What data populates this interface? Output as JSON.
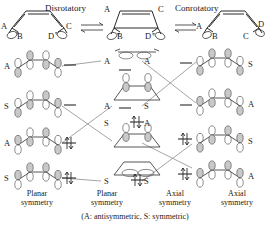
{
  "diagram": {
    "title_caption": "(A: antisymmetric, S: symmetric)",
    "reactions": {
      "disrotatory_label": "Disrotatory",
      "conrotatory_label": "Conrotatory"
    },
    "top_row": {
      "left_molecule": {
        "name": "butadiene-left",
        "substituents": [
          "A",
          "B",
          "D",
          "C"
        ]
      },
      "center_molecule": {
        "name": "cyclobutene",
        "substituents": [
          "A",
          "C",
          "B",
          "D"
        ]
      },
      "right_molecule": {
        "name": "butadiene-right",
        "substituents": [
          "A",
          "D",
          "B",
          "C"
        ]
      }
    },
    "columns": [
      {
        "id": "planar-butadiene",
        "caption_line1": "Planar",
        "caption_line2": "symmetry",
        "levels": [
          {
            "symmetry": "A",
            "occupied": false,
            "electrons": 0
          },
          {
            "symmetry": "S",
            "occupied": false,
            "electrons": 0
          },
          {
            "symmetry": "A",
            "occupied": true,
            "electrons": 2
          },
          {
            "symmetry": "S",
            "occupied": true,
            "electrons": 2
          }
        ]
      },
      {
        "id": "planar-cyclobutene",
        "caption_line1": "Planar",
        "caption_line2": "symmetry",
        "levels": [
          {
            "symmetry": "A",
            "occupied": false,
            "electrons": 0
          },
          {
            "symmetry": "A",
            "occupied": false,
            "electrons": 0
          },
          {
            "symmetry": "S",
            "occupied": true,
            "electrons": 2
          },
          {
            "symmetry": "S",
            "occupied": true,
            "electrons": 2
          }
        ]
      },
      {
        "id": "axial-cyclobutene",
        "caption_line1": "Axial",
        "caption_line2": "symmetry",
        "levels": [
          {
            "symmetry": "A",
            "occupied": false,
            "electrons": 0
          },
          {
            "symmetry": "S",
            "occupied": false,
            "electrons": 0
          },
          {
            "symmetry": "A",
            "occupied": true,
            "electrons": 2
          },
          {
            "symmetry": "S",
            "occupied": true,
            "electrons": 2
          }
        ]
      },
      {
        "id": "axial-butadiene",
        "caption_line1": "Axial",
        "caption_line2": "symmetry",
        "levels": [
          {
            "symmetry": "S",
            "occupied": false,
            "electrons": 0
          },
          {
            "symmetry": "A",
            "occupied": false,
            "electrons": 0
          },
          {
            "symmetry": "S",
            "occupied": true,
            "electrons": 2
          },
          {
            "symmetry": "A",
            "occupied": true,
            "electrons": 2
          }
        ]
      }
    ]
  }
}
